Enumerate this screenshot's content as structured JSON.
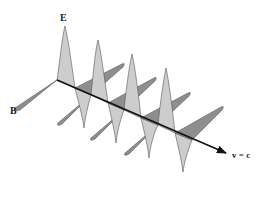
{
  "diagram": {
    "labels": {
      "electric_field": "E",
      "magnetic_field": "B",
      "velocity": "v = c"
    },
    "colors": {
      "e_field_fill": "#cdcdcd",
      "b_field_fill": "#8e8e8e",
      "outline": "#555555",
      "axis": "#111111",
      "background": "#ffffff"
    },
    "periods_shown": 4
  }
}
